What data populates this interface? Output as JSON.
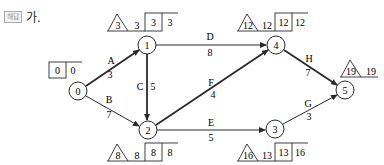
{
  "header": {
    "badge": "해답",
    "label": "가."
  },
  "nodes": [
    {
      "id": "0",
      "x": 78,
      "y": 91
    },
    {
      "id": "1",
      "x": 147,
      "y": 45
    },
    {
      "id": "2",
      "x": 148,
      "y": 130
    },
    {
      "id": "3",
      "x": 275,
      "y": 129
    },
    {
      "id": "4",
      "x": 276,
      "y": 45
    },
    {
      "id": "5",
      "x": 345,
      "y": 90
    }
  ],
  "edges": [
    {
      "name": "A",
      "duration": "3",
      "from": "0",
      "to": "1",
      "critical": true
    },
    {
      "name": "B",
      "duration": "7",
      "from": "0",
      "to": "2",
      "critical": false
    },
    {
      "name": "C",
      "duration": "5",
      "from": "1",
      "to": "2",
      "critical": true
    },
    {
      "name": "D",
      "duration": "8",
      "from": "1",
      "to": "4",
      "critical": false
    },
    {
      "name": "E",
      "duration": "5",
      "from": "2",
      "to": "3",
      "critical": false
    },
    {
      "name": "F",
      "duration": "4",
      "from": "2",
      "to": "4",
      "critical": true
    },
    {
      "name": "G",
      "duration": "3",
      "from": "3",
      "to": "5",
      "critical": false
    },
    {
      "name": "H",
      "duration": "7",
      "from": "4",
      "to": "5",
      "critical": true
    }
  ],
  "annotations": {
    "n0": {
      "box1": "0",
      "box2": "0"
    },
    "n1": {
      "tri": "3",
      "t": "3",
      "box": "3",
      "b": "3"
    },
    "n2": {
      "tri": "8",
      "t": "8",
      "box": "8",
      "b": "8"
    },
    "n3": {
      "tri": "16",
      "t": "13",
      "box": "13",
      "b": "16"
    },
    "n4": {
      "tri": "12",
      "t": "12",
      "box": "12",
      "b": "12"
    },
    "n5": {
      "tri": "19",
      "t": "19"
    }
  }
}
